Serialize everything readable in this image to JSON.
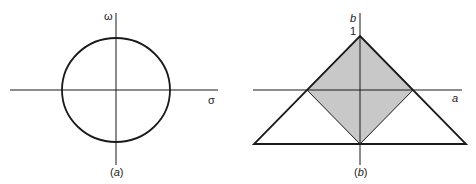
{
  "panels": [
    {
      "id": "a",
      "caption": "(a)",
      "caption_letter": "a",
      "x_axis_label": "σ",
      "y_axis_label": "ω",
      "shape": "circle"
    },
    {
      "id": "b",
      "caption": "(b)",
      "caption_letter": "b",
      "x_axis_label": "a",
      "y_axis_label": "b",
      "y_tick_label": "1",
      "shape": "triangle with shaded diamond"
    }
  ],
  "colors": {
    "stroke": "#1a1a1a",
    "shade": "#c8c8c8",
    "background": "#ffffff"
  }
}
